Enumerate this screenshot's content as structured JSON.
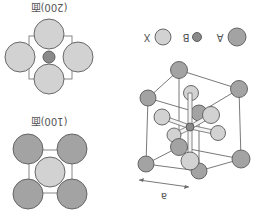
{
  "figure": {
    "orientation": "rotated 180 degrees",
    "colors": {
      "atom_A": "#9e9e9e",
      "atom_B": "#8a8a8a",
      "atom_X": "#cdcdcd",
      "outline": "#5a5a5a",
      "line": "#6a6a6a",
      "text": "#555555"
    }
  },
  "legend": {
    "items": [
      {
        "key": "A",
        "label": "A"
      },
      {
        "key": "B",
        "label": "B"
      },
      {
        "key": "X",
        "label": "X"
      }
    ]
  },
  "panels": {
    "face_200": {
      "label": "(200)面"
    },
    "face_100": {
      "label": "(100)面"
    }
  },
  "unit_cell": {
    "lattice_label": "a"
  }
}
